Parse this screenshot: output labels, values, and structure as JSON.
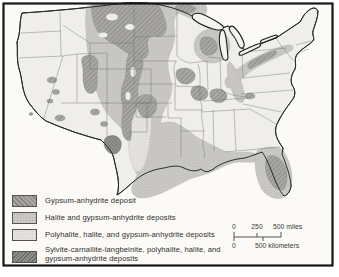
{
  "legend": {
    "items": [
      {
        "label": "Gypsum-anhydrite deposit",
        "color": "#a1a09d",
        "pattern": "diagonal-hatch"
      },
      {
        "label": "Halite and gypsum-anhydrite deposits",
        "color": "#c9c8c5",
        "pattern": "stipple"
      },
      {
        "label": "Polyhalite, halite, and gypsum-anhydrite deposits",
        "color": "#e2e1dd",
        "pattern": "light-stipple"
      },
      {
        "label": "Sylvite-carnallite-langbeinite, polyhalite, halite, and gypsum-anhydrite deposits",
        "color": "#908f8d",
        "pattern": "dense-hatch"
      }
    ]
  },
  "scale_bar": {
    "miles": {
      "tick0": "0",
      "tick250": "250",
      "tick500": "500 miles"
    },
    "kilometers": {
      "tick0": "0",
      "tick500": "500 kilometers"
    }
  },
  "map": {
    "colors": {
      "frame": "#161616",
      "background": "#fbfaf7",
      "land": "#efeeea",
      "state_lines": "#6f6f6d",
      "coast_outline": "#2a2a2a",
      "lakes": "#f4f3f0"
    }
  }
}
